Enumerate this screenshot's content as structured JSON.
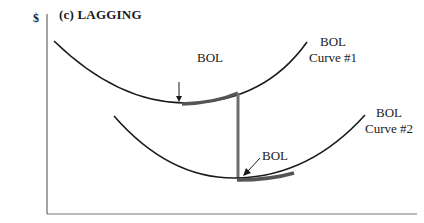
{
  "diagram": {
    "title": "(c) LAGGING",
    "y_axis_unit": "$",
    "y_axis_label_line1": "Cost per unit produced or service",
    "y_axis_label_line2": "rendered",
    "curve1_label_line1": "BOL",
    "curve1_label_line2": "Curve #1",
    "curve2_label_line1": "BOL",
    "curve2_label_line2": "Curve #2",
    "bol_point1_label": "BOL",
    "bol_point2_label": "BOL",
    "colors": {
      "curve": "#1a1a1a",
      "highlight": "#555555",
      "transition": "#6e6e6e",
      "axis": "#666666"
    }
  }
}
